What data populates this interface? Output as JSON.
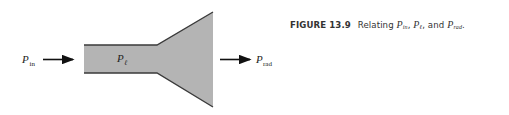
{
  "figure": {
    "label": "FIGURE 13.9",
    "caption_text": "Relating",
    "caption_sep1": ",",
    "caption_sep2": ", and",
    "caption_end": ".",
    "caption_symbols": [
      {
        "base": "P",
        "sub": "in"
      },
      {
        "base": "P",
        "sub": "ℓ"
      },
      {
        "base": "P",
        "sub": "rad"
      }
    ]
  },
  "diagram": {
    "input_label": {
      "base": "P",
      "sub": "in"
    },
    "loss_label": {
      "base": "P",
      "sub": "ℓ"
    },
    "output_label": {
      "base": "P",
      "sub": "rad"
    },
    "fill_color": "#b4b4b4",
    "edge_color": "#3a3a3a",
    "arrow_color": "#111111"
  }
}
